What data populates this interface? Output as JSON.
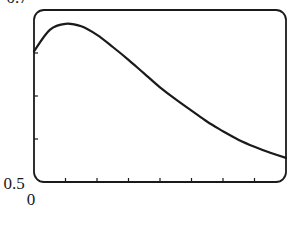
{
  "chart_data": {
    "type": "line",
    "title": "",
    "xlabel": "",
    "ylabel": "",
    "xlim": [
      0,
      8
    ],
    "ylim": [
      0.5,
      0.7
    ],
    "x_tick_count": 9,
    "y_tick_count": 5,
    "x_tick_labels": [
      "0"
    ],
    "y_tick_labels": [
      "0.5",
      "0.7"
    ],
    "grid": false,
    "legend": null,
    "series": [
      {
        "name": "curve",
        "color": "#1a1a1a",
        "x": [
          0,
          0.5,
          1,
          1.5,
          2,
          2.5,
          3,
          3.5,
          4,
          4.5,
          5,
          5.5,
          6,
          6.5,
          7,
          7.5,
          8
        ],
        "y": [
          0.652,
          0.677,
          0.684,
          0.681,
          0.671,
          0.657,
          0.642,
          0.626,
          0.61,
          0.596,
          0.583,
          0.57,
          0.559,
          0.549,
          0.541,
          0.534,
          0.528
        ]
      }
    ]
  },
  "labels": {
    "y_top": "0.7",
    "y_bottom": "0.5",
    "x_origin": "0"
  }
}
